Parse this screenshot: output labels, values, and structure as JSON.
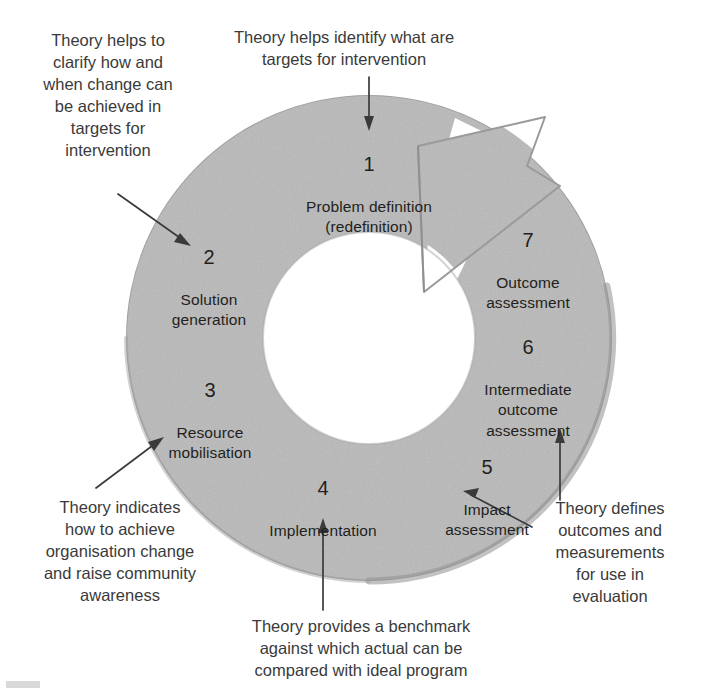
{
  "diagram": {
    "ring_color": "#b9b9b9",
    "ring_edge_color": "#9a9a9a",
    "text_color": "#231f20",
    "note_color": "#3a3a3a",
    "arrow_color": "#3a3a3a",
    "steps": [
      {
        "num": "1",
        "name": "Problem definition\n(redefinition)"
      },
      {
        "num": "2",
        "name": "Solution\ngeneration"
      },
      {
        "num": "3",
        "name": "Resource\nmobilisation"
      },
      {
        "num": "4",
        "name": "Implementation"
      },
      {
        "num": "5",
        "name": "Impact\nassessment"
      },
      {
        "num": "6",
        "name": "Intermediate\noutcome\nassessment"
      },
      {
        "num": "7",
        "name": "Outcome\nassessment"
      }
    ],
    "notes": [
      {
        "id": "note-top-left",
        "text": "Theory helps to\nclarify how and\nwhen change can\nbe achieved in\ntargets for\nintervention"
      },
      {
        "id": "note-top",
        "text": "Theory helps identify what are\ntargets for intervention"
      },
      {
        "id": "note-bottom-left",
        "text": "Theory indicates\nhow to achieve\norganisation change\nand raise community\nawareness"
      },
      {
        "id": "note-bottom",
        "text": "Theory provides a benchmark\nagainst which actual can be\ncompared with ideal program"
      },
      {
        "id": "note-bottom-right",
        "text": "Theory defines\noutcomes and\nmeasurements\nfor use in\nevaluation"
      }
    ]
  }
}
